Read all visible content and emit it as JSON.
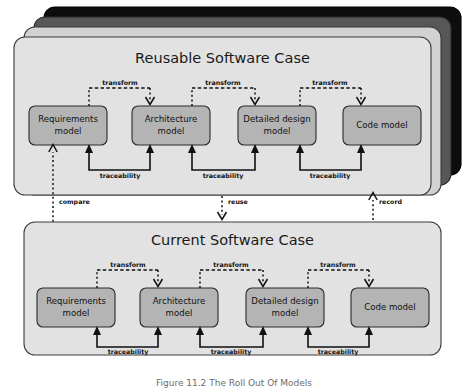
{
  "figure": {
    "caption": "Figure 11.2  The Roll Out Of Models"
  },
  "cases": [
    {
      "id": "reusable",
      "title": "Reusable Software Case",
      "stacked": true,
      "stack_layer_count": 3,
      "models": [
        {
          "line1": "Requirements",
          "line2": "model"
        },
        {
          "line1": "Architecture",
          "line2": "model"
        },
        {
          "line1": "Detailed design",
          "line2": "model"
        },
        {
          "line1": "Code model",
          "line2": ""
        }
      ],
      "transform_labels": [
        "transform",
        "transform",
        "transform"
      ],
      "traceability_labels": [
        "traceability",
        "traceability",
        "traceability"
      ]
    },
    {
      "id": "current",
      "title": "Current Software Case",
      "stacked": false,
      "stack_layer_count": 0,
      "models": [
        {
          "line1": "Requirements",
          "line2": "model"
        },
        {
          "line1": "Architecture",
          "line2": "model"
        },
        {
          "line1": "Detailed design",
          "line2": "model"
        },
        {
          "line1": "Code model",
          "line2": ""
        }
      ],
      "transform_labels": [
        "transform",
        "transform",
        "transform"
      ],
      "traceability_labels": [
        "traceability",
        "traceability",
        "traceability"
      ]
    }
  ],
  "inter_case_links": [
    {
      "id": "compare",
      "label": "compare",
      "direction": "up"
    },
    {
      "id": "reuse",
      "label": "reuse",
      "direction": "down"
    },
    {
      "id": "record",
      "label": "record",
      "direction": "up"
    }
  ],
  "colors": {
    "card_fill": "#e2e2e2",
    "card_stroke": "#3a3a3a",
    "model_fill": "#b4b4b4",
    "model_stroke": "#2a2a2a",
    "stack_layer_1": "#d2d2d2",
    "stack_layer_2": "#575757",
    "stack_layer_3": "#0d0d0d",
    "line": "#111111",
    "text": "#111111",
    "caption_text": "#6d6d6d",
    "background": "#ffffff"
  }
}
